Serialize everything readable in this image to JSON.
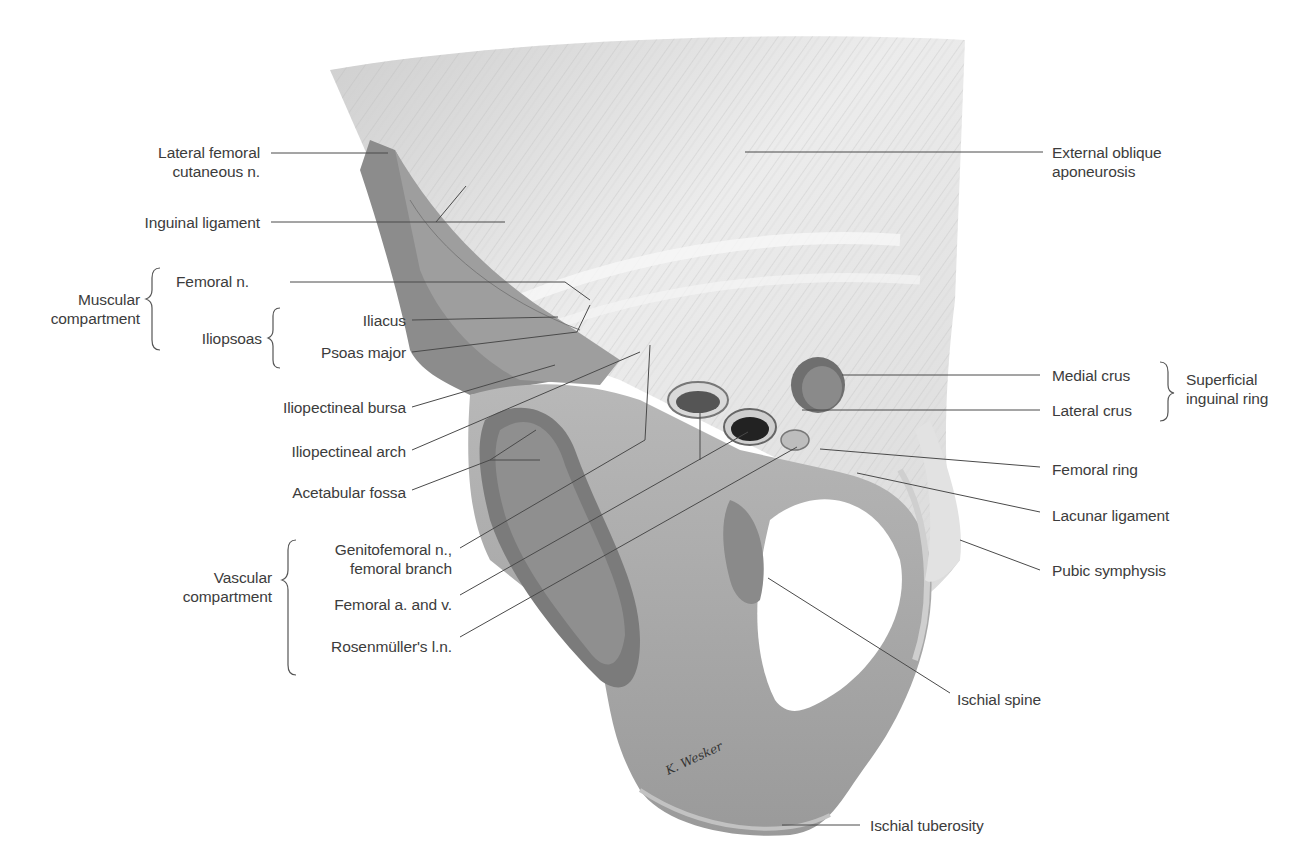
{
  "figure": {
    "signature": "K. Wesker"
  },
  "labels": {
    "lateral_femoral_cutaneous": "Lateral femoral\ncutaneous n.",
    "lateral_femoral_cutaneous_l1": "Lateral femoral",
    "lateral_femoral_cutaneous_l2": "cutaneous n.",
    "inguinal_ligament": "Inguinal ligament",
    "femoral_n": "Femoral n.",
    "muscular_compartment_l1": "Muscular",
    "muscular_compartment_l2": "compartment",
    "iliopsoas": "Iliopsoas",
    "iliacus": "Iliacus",
    "psoas_major": "Psoas major",
    "iliopectineal_bursa": "Iliopectineal bursa",
    "iliopectineal_arch": "Iliopectineal arch",
    "acetabular_fossa": "Acetabular fossa",
    "genitofemoral_l1": "Genitofemoral n.,",
    "genitofemoral_l2": "femoral branch",
    "femoral_a_v": "Femoral a. and v.",
    "rosenmuller": "Rosenmüller's l.n.",
    "vascular_compartment_l1": "Vascular",
    "vascular_compartment_l2": "compartment",
    "external_oblique_l1": "External oblique",
    "external_oblique_l2": "aponeurosis",
    "medial_crus": "Medial crus",
    "lateral_crus": "Lateral crus",
    "superficial_ring_l1": "Superficial",
    "superficial_ring_l2": "inguinal ring",
    "femoral_ring": "Femoral ring",
    "lacunar_ligament": "Lacunar ligament",
    "pubic_symphysis": "Pubic symphysis",
    "ischial_spine": "Ischial spine",
    "ischial_tuberosity": "Ischial tuberosity"
  },
  "colors": {
    "text": "#3c3c3c",
    "leader": "#4a4a4a",
    "bone": "#a9a9a9",
    "aponeurosis": "#e6e6e6",
    "background": "#ffffff"
  }
}
